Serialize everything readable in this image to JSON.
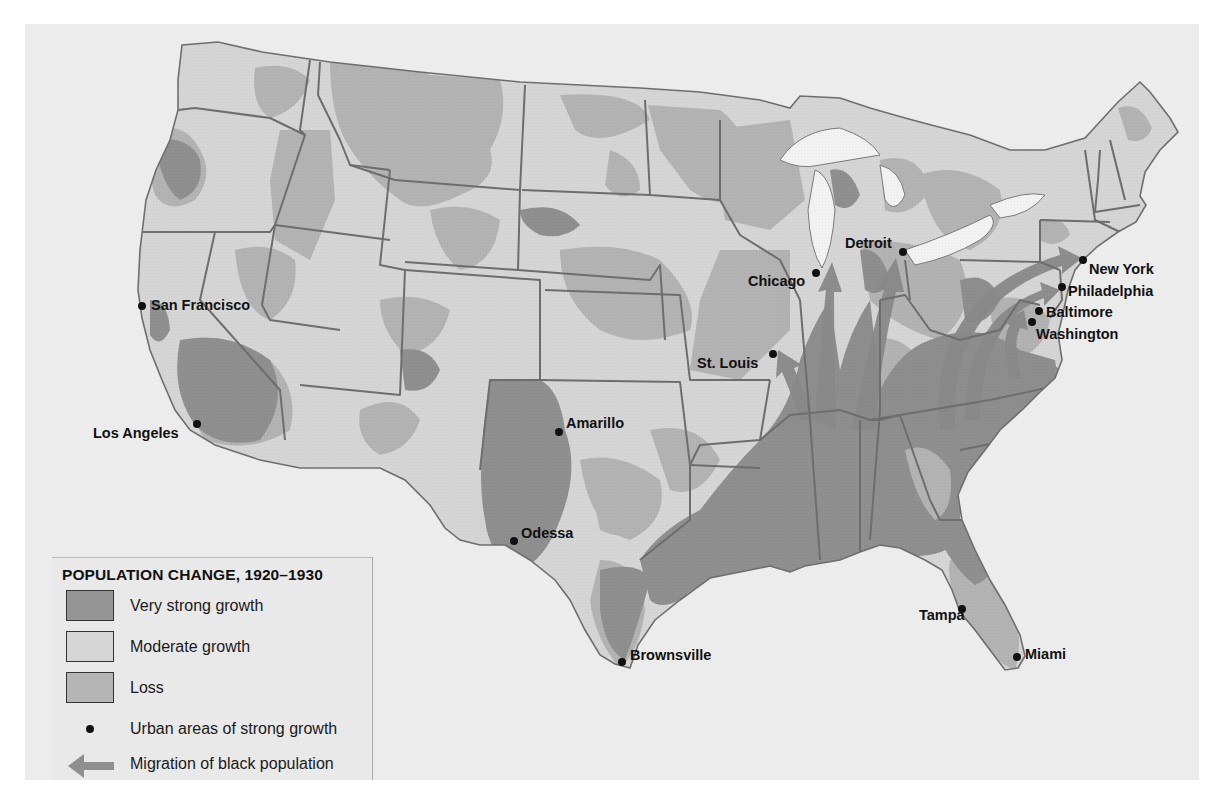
{
  "legend": {
    "title": "POPULATION CHANGE, 1920–1930",
    "items": [
      {
        "label": "Very strong growth",
        "color": "#959595",
        "type": "swatch"
      },
      {
        "label": "Moderate growth",
        "color": "#d5d5d5",
        "type": "swatch"
      },
      {
        "label": "Loss",
        "color": "#b5b5b5",
        "type": "swatch"
      },
      {
        "label": "Urban areas of strong growth",
        "type": "dot-icon"
      },
      {
        "label": "Migration of black population",
        "type": "arrow-icon",
        "color": "#8f8f8f"
      }
    ]
  },
  "cities": [
    {
      "name": "San Francisco",
      "dot": [
        142,
        306
      ],
      "label": [
        151,
        298
      ]
    },
    {
      "name": "Los Angeles",
      "dot": [
        197,
        424
      ],
      "label": [
        93,
        426
      ]
    },
    {
      "name": "Amarillo",
      "dot": [
        559,
        432
      ],
      "label": [
        566,
        416
      ]
    },
    {
      "name": "Odessa",
      "dot": [
        514,
        541
      ],
      "label": [
        521,
        526
      ]
    },
    {
      "name": "Brownsville",
      "dot": [
        622,
        662
      ],
      "label": [
        630,
        648
      ]
    },
    {
      "name": "St. Louis",
      "dot": [
        773,
        354
      ],
      "label": [
        697,
        356
      ]
    },
    {
      "name": "Chicago",
      "dot": [
        816,
        273
      ],
      "label": [
        748,
        274
      ]
    },
    {
      "name": "Detroit",
      "dot": [
        903,
        252
      ],
      "label": [
        845,
        236
      ]
    },
    {
      "name": "New York",
      "dot": [
        1083,
        260
      ],
      "label": [
        1089,
        262
      ]
    },
    {
      "name": "Philadelphia",
      "dot": [
        1062,
        287
      ],
      "label": [
        1068,
        284
      ]
    },
    {
      "name": "Baltimore",
      "dot": [
        1039,
        311
      ],
      "label": [
        1046,
        305
      ]
    },
    {
      "name": "Washington",
      "dot": [
        1032,
        322
      ],
      "label": [
        1036,
        327
      ]
    },
    {
      "name": "Tampa",
      "dot": [
        962,
        609
      ],
      "label": [
        919,
        608
      ]
    },
    {
      "name": "Miami",
      "dot": [
        1017,
        657
      ],
      "label": [
        1025,
        647
      ]
    }
  ],
  "colors": {
    "background": "#ececec",
    "very_strong_growth": "#8f8f8f",
    "moderate_growth": "#d5d5d5",
    "loss": "#b3b3b3",
    "border": "#6e6e6e",
    "arrow": "#8a8a8a"
  }
}
